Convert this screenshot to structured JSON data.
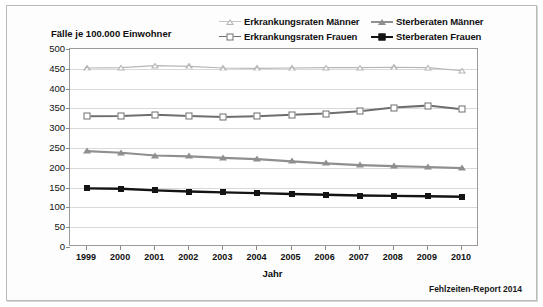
{
  "y_axis_title": "Fälle je 100.000 Einwohner",
  "footer": "Fehlzeiten-Report 2014",
  "legend": [
    {
      "label": "Erkrankungsraten Männer",
      "marker": "triangle-open",
      "color": "#b6b6b6"
    },
    {
      "label": "Sterberaten Männer",
      "marker": "triangle-filled",
      "color": "#8f8f8f"
    },
    {
      "label": "Erkrankungsraten Frauen",
      "marker": "square-open",
      "color": "#6e6e6e"
    },
    {
      "label": "Sterberaten Frauen",
      "marker": "square-filled",
      "color": "#141414"
    }
  ],
  "chart_data": {
    "type": "line",
    "title": "",
    "subtitle": "",
    "xlabel": "Jahr",
    "ylabel": "Fälle je 100.000 Einwohner",
    "categories": [
      "1999",
      "2000",
      "2001",
      "2002",
      "2003",
      "2004",
      "2005",
      "2006",
      "2007",
      "2008",
      "2009",
      "2010"
    ],
    "x": [
      1999,
      2000,
      2001,
      2002,
      2003,
      2004,
      2005,
      2006,
      2007,
      2008,
      2009,
      2010
    ],
    "ylim": [
      0,
      500
    ],
    "ytick_labels": [
      "0",
      "50",
      "100",
      "150",
      "200",
      "250",
      "300",
      "350",
      "400",
      "450",
      "500"
    ],
    "ytick_values": [
      0,
      50,
      100,
      150,
      200,
      250,
      300,
      350,
      400,
      450,
      500
    ],
    "grid": true,
    "legend_position": "top",
    "series": [
      {
        "name": "Erkrankungsraten Männer",
        "marker": "triangle-open",
        "color": "#b6b6b6",
        "values": [
          452,
          453,
          458,
          456,
          452,
          451,
          452,
          453,
          453,
          454,
          453,
          445
        ]
      },
      {
        "name": "Erkrankungsraten Frauen",
        "marker": "square-open",
        "color": "#6e6e6e",
        "values": [
          330,
          331,
          334,
          331,
          328,
          330,
          334,
          337,
          343,
          352,
          357,
          348
        ]
      },
      {
        "name": "Sterberaten Männer",
        "marker": "triangle-filled",
        "color": "#8f8f8f",
        "values": [
          242,
          238,
          231,
          229,
          225,
          222,
          216,
          211,
          207,
          204,
          202,
          199
        ]
      },
      {
        "name": "Sterberaten Frauen",
        "marker": "square-filled",
        "color": "#141414",
        "values": [
          148,
          147,
          143,
          140,
          138,
          136,
          134,
          132,
          130,
          129,
          128,
          127
        ]
      }
    ]
  }
}
